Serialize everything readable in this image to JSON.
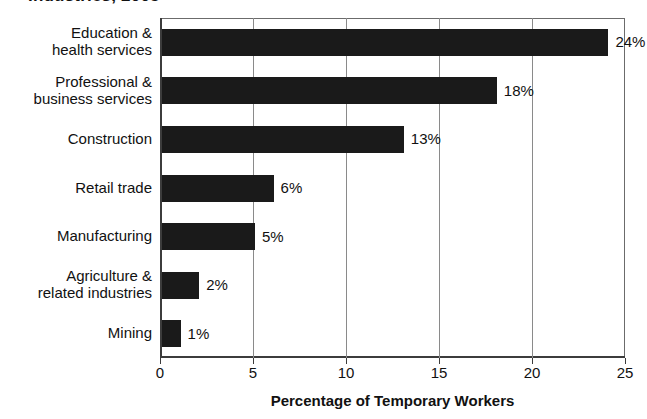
{
  "chart_data": {
    "type": "bar",
    "orientation": "horizontal",
    "title": "Industries, 2005",
    "xlabel": "Percentage of Temporary Workers",
    "ylabel": "",
    "xlim": [
      0,
      25
    ],
    "xticks": [
      0,
      5,
      10,
      15,
      20,
      25
    ],
    "xtick_labels": [
      "0",
      "5",
      "10",
      "15",
      "20",
      "25"
    ],
    "grid": true,
    "grid_axis": "x",
    "legend": false,
    "bar_color": "#1a1a1a",
    "categories": [
      "Education & health services",
      "Professional & business services",
      "Construction",
      "Retail trade",
      "Manufacturing",
      "Agriculture & related industries",
      "Mining"
    ],
    "category_lines": [
      [
        "Education &",
        "health services"
      ],
      [
        "Professional &",
        "business services"
      ],
      [
        "Construction"
      ],
      [
        "Retail trade"
      ],
      [
        "Manufacturing"
      ],
      [
        "Agriculture &",
        "related industries"
      ],
      [
        "Mining"
      ]
    ],
    "values": [
      24,
      18,
      13,
      6,
      5,
      2,
      1
    ],
    "value_labels": [
      "24%",
      "18%",
      "13%",
      "6%",
      "5%",
      "2%",
      "1%"
    ]
  }
}
